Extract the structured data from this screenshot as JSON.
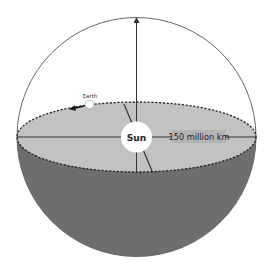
{
  "diagram": {
    "labels": {
      "sun": "Sun",
      "earth": "Earth",
      "distance": "150 million km"
    },
    "colors": {
      "background": "#ffffff",
      "sphere_outline": "#555555",
      "orbit_plane_fill": "#c2c2c2",
      "lower_hemisphere_fill": "#6e6e6e",
      "orbit_dashes": "#222222",
      "axis_lines": "#333333",
      "sun_fill": "#ffffff",
      "earth_fill": "#ffffff",
      "distance_label_bg": "#b4b4b4"
    }
  }
}
